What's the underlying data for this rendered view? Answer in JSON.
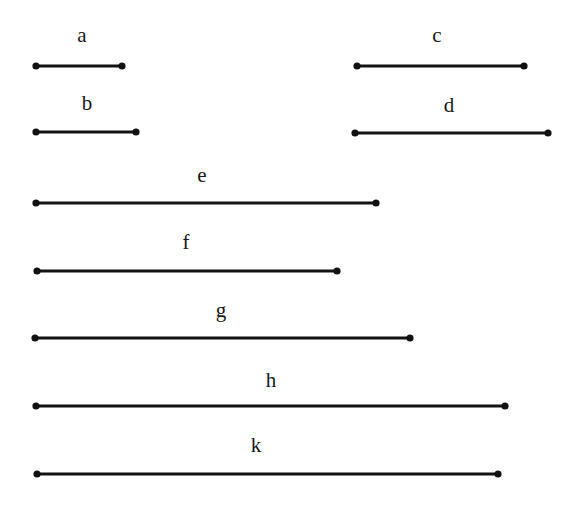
{
  "figure": {
    "background_color": "#ffffff",
    "stroke_color": "#121212",
    "text_color": "#171717",
    "width": 577,
    "height": 507
  },
  "chart_data": {
    "type": "bar",
    "orientation": "horizontal",
    "title": "",
    "xlabel": "",
    "ylabel": "",
    "grid": false,
    "legend": null,
    "axis_visible": false,
    "units": "pixels",
    "categories": [
      "a",
      "b",
      "c",
      "d",
      "e",
      "f",
      "g",
      "h",
      "k"
    ],
    "values": [
      86,
      100,
      167,
      193,
      340,
      300,
      375,
      469,
      461
    ],
    "segments": [
      {
        "label": "a",
        "x_start": 36,
        "x_end": 122,
        "y": 66,
        "length": 86,
        "label_x": 82,
        "label_y": 46
      },
      {
        "label": "b",
        "x_start": 36,
        "x_end": 136,
        "y": 132,
        "length": 100,
        "label_x": 87,
        "label_y": 114
      },
      {
        "label": "c",
        "x_start": 357,
        "x_end": 524,
        "y": 66,
        "length": 167,
        "label_x": 437,
        "label_y": 46
      },
      {
        "label": "d",
        "x_start": 355,
        "x_end": 548,
        "y": 133,
        "length": 193,
        "label_x": 449,
        "label_y": 116
      },
      {
        "label": "e",
        "x_start": 36,
        "x_end": 376,
        "y": 203,
        "length": 340,
        "label_x": 202,
        "label_y": 186
      },
      {
        "label": "f",
        "x_start": 37,
        "x_end": 337,
        "y": 271,
        "length": 300,
        "label_x": 186,
        "label_y": 253
      },
      {
        "label": "g",
        "x_start": 35,
        "x_end": 410,
        "y": 338,
        "length": 375,
        "label_x": 221,
        "label_y": 321
      },
      {
        "label": "h",
        "x_start": 36,
        "x_end": 505,
        "y": 406,
        "length": 469,
        "label_x": 271,
        "label_y": 391
      },
      {
        "label": "k",
        "x_start": 37,
        "x_end": 498,
        "y": 474,
        "length": 461,
        "label_x": 256,
        "label_y": 456
      }
    ]
  }
}
